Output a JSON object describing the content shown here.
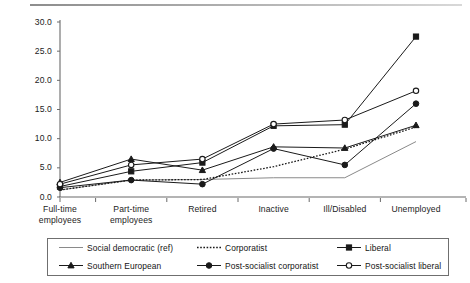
{
  "chart_data": {
    "type": "line",
    "title": "",
    "subtitle": "",
    "xlabel": "",
    "ylabel": "",
    "ylim": [
      0.0,
      30.0
    ],
    "yticks": [
      "0.0",
      "5.0",
      "10.0",
      "15.0",
      "20.0",
      "25.0",
      "30.0"
    ],
    "ytick_values": [
      0.0,
      5.0,
      10.0,
      15.0,
      20.0,
      25.0,
      30.0
    ],
    "grid": false,
    "legend_position": "bottom",
    "legend_columns": 3,
    "categories": [
      "Full-time employees",
      "Part-time employees",
      "Retired",
      "Inactive",
      "Ill/Disabled",
      "Unemployed"
    ],
    "category_lines": [
      [
        "Full-time",
        "employees"
      ],
      [
        "Part-time",
        "employees"
      ],
      [
        "Retired"
      ],
      [
        "Inactive"
      ],
      [
        "Ill/Disabled"
      ],
      [
        "Unemployed"
      ]
    ],
    "series": [
      {
        "name": "Social democratic (ref)",
        "marker": "none",
        "dash": "solid",
        "color": "#8a8a8a",
        "values": [
          1.2,
          2.9,
          3.0,
          3.3,
          3.3,
          9.5
        ]
      },
      {
        "name": "Corporatist",
        "marker": "none",
        "dash": "dotted",
        "color": "#1a1a1a",
        "values": [
          1.2,
          2.9,
          3.0,
          5.2,
          8.2,
          12.0
        ]
      },
      {
        "name": "Liberal",
        "marker": "square-filled",
        "dash": "solid",
        "color": "#1a1a1a",
        "values": [
          1.8,
          4.4,
          5.9,
          12.2,
          12.4,
          27.5
        ]
      },
      {
        "name": "Southern European",
        "marker": "triangle-filled",
        "dash": "solid",
        "color": "#1a1a1a",
        "values": [
          2.5,
          6.5,
          4.6,
          8.6,
          8.4,
          12.3
        ]
      },
      {
        "name": "Post-socialist corporatist",
        "marker": "circle-filled",
        "dash": "solid",
        "color": "#1a1a1a",
        "values": [
          1.6,
          2.9,
          2.2,
          8.3,
          5.5,
          16.0
        ]
      },
      {
        "name": "Post-socialist liberal",
        "marker": "circle-open",
        "dash": "solid",
        "color": "#1a1a1a",
        "values": [
          2.2,
          5.5,
          6.5,
          12.5,
          13.2,
          18.2
        ]
      }
    ]
  },
  "legend": {
    "items": [
      {
        "label": "Social democratic (ref)"
      },
      {
        "label": "Corporatist"
      },
      {
        "label": "Liberal"
      },
      {
        "label": "Southern European"
      },
      {
        "label": "Post-socialist corporatist"
      },
      {
        "label": "Post-socialist liberal"
      }
    ]
  }
}
